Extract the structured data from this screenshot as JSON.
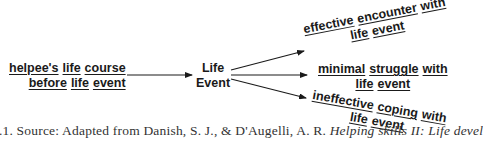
{
  "diagram": {
    "source_node": {
      "line1": [
        "helpee's",
        "life",
        "course"
      ],
      "line2": [
        "before",
        "life",
        "event"
      ]
    },
    "center_node": {
      "line1": "Life",
      "line2": "Event"
    },
    "outcomes": [
      {
        "line1": [
          "effective",
          "encounter",
          "with"
        ],
        "line2": [
          "life",
          "event"
        ]
      },
      {
        "line1": [
          "minimal",
          "struggle",
          "with"
        ],
        "line2": [
          "life",
          "event"
        ]
      },
      {
        "line1": [
          "ineffective",
          "coping",
          "with"
        ],
        "line2": [
          "life",
          "event"
        ]
      }
    ]
  },
  "caption": {
    "prefix": "4.1. Source: Adapted from Danish, S. J., & D'Augelli, A. R. ",
    "title": "Helping skills II: Life devel"
  }
}
